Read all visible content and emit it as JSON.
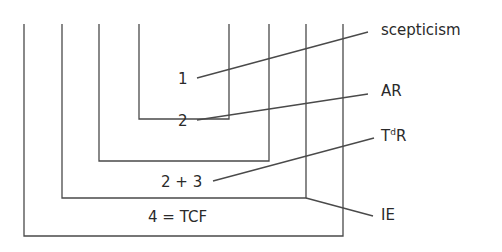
{
  "diagram": {
    "boxes": [
      {
        "id": "box-1",
        "label": "1"
      },
      {
        "id": "box-2",
        "label": "2"
      },
      {
        "id": "box-3",
        "label": "2 + 3"
      },
      {
        "id": "box-4",
        "label": "4 = TCF"
      }
    ],
    "callouts": {
      "scepticism": "scepticism",
      "ar": "AR",
      "tdr_base": "T",
      "tdr_sup": "d",
      "tdr_end": "R",
      "ie": "IE"
    }
  }
}
